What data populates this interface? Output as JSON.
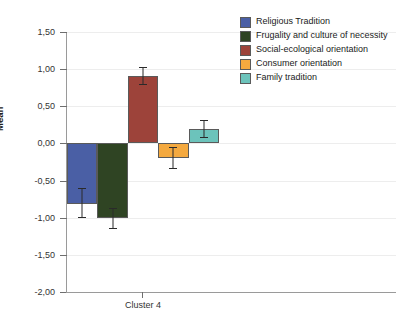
{
  "chart_data": {
    "type": "bar",
    "title": "",
    "subtitle": "",
    "xlabel": "",
    "ylabel": "Mean",
    "categories": [
      "Cluster 4"
    ],
    "ylim": [
      -2.0,
      1.5
    ],
    "ytick_labels": [
      "1,50",
      "1,00",
      "0,50",
      "0,00",
      "-0,50",
      "-1,00",
      "-1,50",
      "-2,00"
    ],
    "ytick_values": [
      1.5,
      1.0,
      0.5,
      0.0,
      -0.5,
      -1.0,
      -1.5,
      -2.0
    ],
    "grid": true,
    "legend_position": "right",
    "error_bars": true,
    "series": [
      {
        "name": "Religious Tradition",
        "color": "#4a5fa5",
        "values": [
          -0.81
        ],
        "error_low": [
          -1.01
        ],
        "error_high": [
          -0.6
        ]
      },
      {
        "name": "Frugality and culture of necessity",
        "color": "#2f4423",
        "values": [
          -1.01
        ],
        "error_low": [
          -1.15
        ],
        "error_high": [
          -0.87
        ]
      },
      {
        "name": "Social-ecological orientation",
        "color": "#9d433a",
        "values": [
          0.91
        ],
        "error_low": [
          0.79
        ],
        "error_high": [
          1.03
        ]
      },
      {
        "name": "Consumer orientation",
        "color": "#f4a93f",
        "values": [
          -0.2
        ],
        "error_low": [
          -0.35
        ],
        "error_high": [
          -0.05
        ]
      },
      {
        "name": "Family tradition",
        "color": "#6cc3bb",
        "values": [
          0.19
        ],
        "error_low": [
          0.07
        ],
        "error_high": [
          0.32
        ]
      }
    ]
  },
  "legend": {
    "items": [
      {
        "label": "Religious Tradition",
        "color": "#4a5fa5"
      },
      {
        "label": "Frugality and culture of necessity",
        "color": "#2f4423"
      },
      {
        "label": "Social-ecological orientation",
        "color": "#9d433a"
      },
      {
        "label": "Consumer orientation",
        "color": "#f4a93f"
      },
      {
        "label": "Family tradition",
        "color": "#6cc3bb"
      }
    ]
  },
  "colors": {
    "axis": "#9a9a9a",
    "grid": "#ededed",
    "text": "#1a1a1a",
    "background": "#ffffff",
    "error_bar": "#2a2a2a"
  }
}
